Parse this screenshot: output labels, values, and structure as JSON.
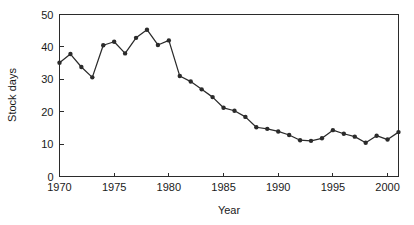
{
  "chart_data": {
    "type": "line",
    "title": "",
    "xlabel": "Year",
    "ylabel": "Stock days",
    "xlim": [
      1970,
      2001
    ],
    "ylim": [
      0,
      50
    ],
    "grid": false,
    "legend": null,
    "xticks": [
      1970,
      1975,
      1980,
      1985,
      1990,
      1995,
      2000
    ],
    "xtick_labels": [
      "1970",
      "1975",
      "1980",
      "1985",
      "1990",
      "1995",
      "2000"
    ],
    "yticks": [
      0,
      10,
      20,
      30,
      40,
      50
    ],
    "ytick_labels": [
      "0",
      "10",
      "20",
      "30",
      "40",
      "50"
    ],
    "series": [
      {
        "name": "Stock days",
        "marker": "filled-circle",
        "color": "#2b2b2b",
        "x": [
          1970,
          1971,
          1972,
          1973,
          1974,
          1975,
          1976,
          1977,
          1978,
          1979,
          1980,
          1981,
          1982,
          1983,
          1984,
          1985,
          1986,
          1987,
          1988,
          1989,
          1990,
          1991,
          1992,
          1993,
          1994,
          1995,
          1996,
          1997,
          1998,
          1999,
          2000,
          2001
        ],
        "values": [
          35.1,
          37.8,
          33.8,
          30.6,
          40.5,
          41.6,
          38.0,
          42.8,
          45.3,
          40.6,
          42.0,
          31.0,
          29.3,
          26.9,
          24.5,
          21.2,
          20.3,
          18.4,
          15.2,
          14.7,
          13.9,
          12.8,
          11.2,
          11.0,
          11.8,
          14.3,
          13.2,
          12.3,
          10.4,
          12.6,
          11.4,
          13.7
        ]
      }
    ]
  }
}
